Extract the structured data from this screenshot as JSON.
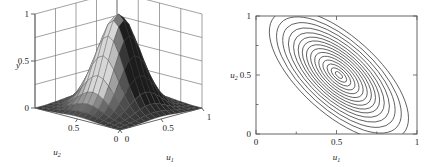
{
  "figure": {
    "panel_count": 2,
    "background": "#ffffff",
    "line_color": "#3a3a3a"
  },
  "chart_data": [
    {
      "type": "surface",
      "panel": "left",
      "title": "",
      "xlabel": "u_1",
      "ylabel": "u_2",
      "zlabel": "y",
      "xlabel_text": "u",
      "xlabel_sub": "1",
      "ylabel_text": "u",
      "ylabel_sub": "2",
      "zlabel_text": "y",
      "xlim": [
        0,
        1
      ],
      "ylim": [
        0,
        1
      ],
      "zlim": [
        0,
        1
      ],
      "xticks": [
        "0",
        "0.5",
        "1"
      ],
      "yticks": [
        "0",
        "0.5"
      ],
      "zticks": [
        "0",
        "0.5",
        "1"
      ],
      "grid": true,
      "grid_walls": [
        "back-left",
        "back-right",
        "floor"
      ],
      "mesh_nx": 16,
      "mesh_ny": 16,
      "shading": "grayscale-faceted",
      "surface_description": "single smooth unimodal bell-shaped peak centred near (0.5, 0.5) rising to y = 1, decaying to y = 0 at the domain edges",
      "peak": {
        "u1": 0.5,
        "u2": 0.5,
        "y": 1.0
      },
      "colors": {
        "face_dark": "#2b2b2b",
        "face_mid": "#8c8c8c",
        "face_light": "#d4d4d4",
        "wire": "#555555"
      }
    },
    {
      "type": "contour",
      "panel": "right",
      "title": "",
      "xlabel": "u_1",
      "ylabel": "u_2",
      "xlabel_text": "u",
      "xlabel_sub": "1",
      "ylabel_text": "u",
      "ylabel_sub": "2",
      "xlim": [
        0,
        1
      ],
      "ylim": [
        0,
        1
      ],
      "xticks": [
        "0",
        "0.5",
        "1"
      ],
      "yticks": [
        "0",
        "0.5",
        "1"
      ],
      "xtick_values": [
        0,
        0.5,
        1
      ],
      "ytick_values": [
        0,
        0.5,
        1
      ],
      "minor_ticks": [
        0.25,
        0.75
      ],
      "grid": false,
      "frame": true,
      "n_levels": 15,
      "center": {
        "u1": 0.515,
        "u2": 0.5
      },
      "orientation_deg": -48,
      "aspect_ratio": 2.25,
      "contour_description": "15 nested tilted ellipses, major axis running from upper-left to lower-right, outermost rings clipped by the plot frame",
      "level_radii_major": [
        0.035,
        0.075,
        0.115,
        0.155,
        0.195,
        0.235,
        0.275,
        0.315,
        0.355,
        0.395,
        0.44,
        0.49,
        0.545,
        0.605,
        0.675
      ],
      "colors": {
        "contour": "#3a3a3a",
        "frame": "#555555"
      }
    }
  ]
}
